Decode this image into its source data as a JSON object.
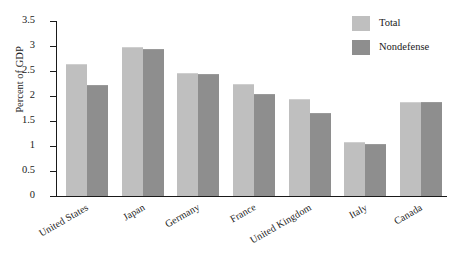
{
  "chart_data": {
    "type": "bar",
    "title": "",
    "subtitle": "",
    "xlabel": "",
    "ylabel": "Percent of GDP",
    "ylim": [
      0,
      3.5
    ],
    "ytick_step": 0.5,
    "ytick_labels": [
      "3.5",
      "3",
      "2.5",
      "2",
      "1.5",
      "1",
      "0.5",
      "0"
    ],
    "ytick_values": [
      3.5,
      3,
      2.5,
      2,
      1.5,
      1,
      0.5,
      0
    ],
    "grid": false,
    "legend_position": "top-right",
    "categories": [
      "United States",
      "Japan",
      "Germany",
      "France",
      "United Kingdom",
      "Italy",
      "Canada"
    ],
    "series": [
      {
        "name": "Total",
        "color": "#bfbfbf",
        "values": [
          2.62,
          2.96,
          2.45,
          2.22,
          1.92,
          1.06,
          1.87
        ]
      },
      {
        "name": "Nondefense",
        "color": "#8e8e8e",
        "values": [
          2.21,
          2.92,
          2.42,
          2.02,
          1.64,
          1.03,
          1.87
        ]
      }
    ],
    "annotations": []
  },
  "legend": {
    "items": [
      {
        "label": "Total",
        "swatch": "total"
      },
      {
        "label": "Nondefense",
        "swatch": "nondefense"
      }
    ]
  },
  "colors": {
    "total": "#bfbfbf",
    "nondefense": "#8e8e8e",
    "axis": "#1a1a1a",
    "background": "#ffffff"
  }
}
